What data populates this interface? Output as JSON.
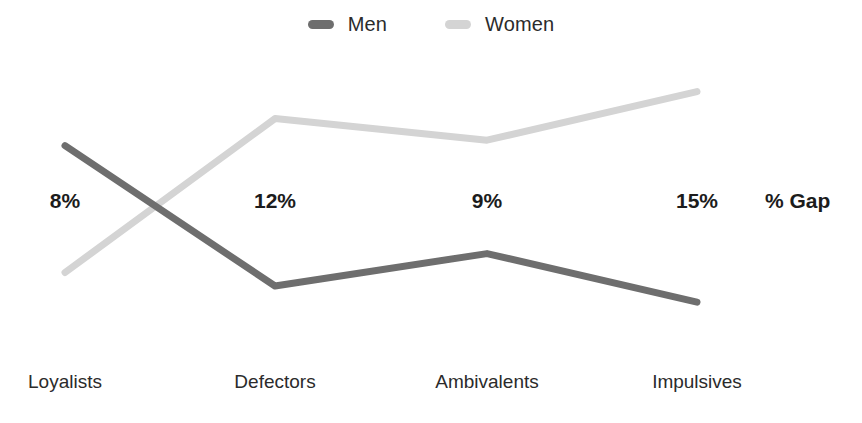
{
  "chart_data": {
    "type": "line",
    "title": "",
    "subtitle": "",
    "xlabel": "",
    "ylabel": "",
    "grid": false,
    "legend_position": "top-center",
    "categories": [
      "Loyalists",
      "Defectors",
      "Ambivalents",
      "Impulsives"
    ],
    "series": [
      {
        "name": "Men",
        "color": "#6e6e6e",
        "values": [
          72,
          20,
          32,
          14
        ]
      },
      {
        "name": "Women",
        "color": "#d4d4d4",
        "values": [
          25,
          82,
          74,
          92
        ]
      }
    ],
    "annotations": {
      "row_label": "% Gap",
      "values": [
        "8%",
        "12%",
        "9%",
        "15%"
      ]
    }
  },
  "legend": {
    "items": [
      {
        "label": "Men",
        "swatch": "men-line-swatch"
      },
      {
        "label": "Women",
        "swatch": "women-line-swatch"
      }
    ]
  },
  "axis": {
    "categories": [
      "Loyalists",
      "Defectors",
      "Ambivalents",
      "Impulsives"
    ]
  },
  "gap_row": {
    "label": "% Gap",
    "values": [
      "8%",
      "12%",
      "9%",
      "15%"
    ]
  },
  "colors": {
    "men": "#6e6e6e",
    "women": "#d4d4d4",
    "text": "#2b2b2b",
    "bold_text": "#1c1c1c",
    "background": "#ffffff"
  }
}
